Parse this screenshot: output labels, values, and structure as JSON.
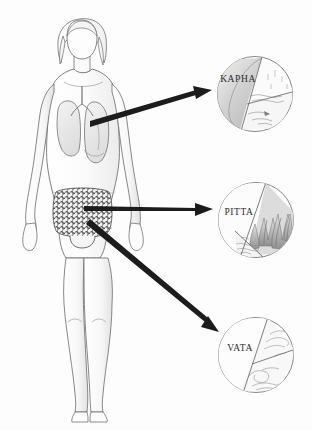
{
  "figure": {
    "background_color": "#fdfdfd",
    "ink_color": "#3a3a3a",
    "arrow_color": "#1c1c1c"
  },
  "body": {
    "name": "human-body-figure",
    "description": "Front-view pencil sketch of a standing human figure with shoulder-length hair",
    "organs": [
      {
        "name": "lungs",
        "region": "chest",
        "shading": "#e9e9e9"
      },
      {
        "name": "trachea",
        "region": "chest",
        "shading": "#f2f2f2"
      },
      {
        "name": "intestines",
        "region": "abdomen",
        "shading": "#6f6f6f"
      }
    ]
  },
  "arrows": [
    {
      "name": "arrow-chest-to-kapha",
      "from": "chest",
      "to": "KAPHA",
      "style": "thick-tapered",
      "color": "#1c1c1c"
    },
    {
      "name": "arrow-abdomen-to-pitta",
      "from": "upper abdomen",
      "to": "PITTA",
      "style": "thin-tapered",
      "color": "#1c1c1c"
    },
    {
      "name": "arrow-lower-abdomen-to-vata",
      "from": "lower abdomen",
      "to": "VATA",
      "style": "thick-tapered",
      "color": "#1c1c1c"
    }
  ],
  "doshas": [
    {
      "id": "kapha",
      "label": "KAPHA",
      "label_x": 238,
      "label_y": 82,
      "center_x": 255,
      "center_y": 94,
      "radius": 38,
      "elements": [
        "earth",
        "water"
      ],
      "sections": [
        {
          "name": "earth-mass",
          "fill": "#d4d4d4"
        },
        {
          "name": "sky-scene",
          "fill": "#fafafa"
        },
        {
          "name": "water-scene",
          "fill": "#f6f6f6"
        }
      ]
    },
    {
      "id": "pitta",
      "label": "PITTA",
      "label_x": 239,
      "label_y": 215,
      "center_x": 256,
      "center_y": 220,
      "radius": 38,
      "elements": [
        "fire",
        "water"
      ],
      "sections": [
        {
          "name": "plain-field",
          "fill": "#fcfcfc"
        },
        {
          "name": "fire-scene",
          "fill": "#bdbdbd"
        },
        {
          "name": "water-scene",
          "fill": "#f4f4f4"
        }
      ]
    },
    {
      "id": "vata",
      "label": "VATA",
      "label_x": 240,
      "label_y": 351,
      "center_x": 256,
      "center_y": 355,
      "radius": 38,
      "elements": [
        "air",
        "ether"
      ],
      "sections": [
        {
          "name": "plain-field",
          "fill": "#fdfdfd"
        },
        {
          "name": "wind-upper",
          "fill": "#f7f7f7"
        },
        {
          "name": "wind-lower",
          "fill": "#f7f7f7"
        }
      ]
    }
  ]
}
